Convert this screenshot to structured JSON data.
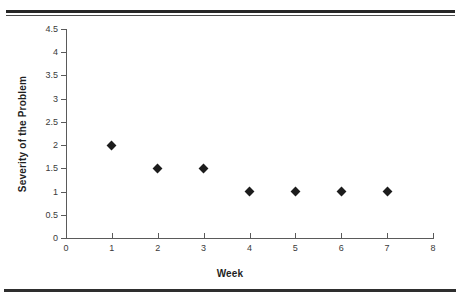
{
  "figure": {
    "background_color": "#ffffff",
    "rule_color": "#2b2b2b",
    "axis_color": "#5a5a5a",
    "marker_color": "#1c1c1c",
    "top_rule_label": "top-double-rule",
    "bottom_rule_label": "bottom-rule"
  },
  "chart_data": {
    "type": "scatter",
    "title": "",
    "subtitle": "",
    "xlabel": "Week",
    "ylabel": "Severity of the Problem",
    "x": [
      1,
      2,
      3,
      4,
      5,
      6,
      7
    ],
    "values": [
      2,
      1.5,
      1.5,
      1,
      1,
      1,
      1
    ],
    "series": [
      {
        "name": "Severity of the Problem",
        "x": [
          1,
          2,
          3,
          4,
          5,
          6,
          7
        ],
        "values": [
          2,
          1.5,
          1.5,
          1,
          1,
          1,
          1
        ],
        "marker": "diamond",
        "color": "#1c1c1c"
      }
    ],
    "xlim": [
      0,
      8
    ],
    "ylim": [
      0,
      4.5
    ],
    "xticks": [
      0,
      1,
      2,
      3,
      4,
      5,
      6,
      7,
      8
    ],
    "xtick_labels": [
      "0",
      "1",
      "2",
      "3",
      "4",
      "5",
      "6",
      "7",
      "8"
    ],
    "yticks": [
      0,
      0.5,
      1,
      1.5,
      2,
      2.5,
      3,
      3.5,
      4,
      4.5
    ],
    "ytick_labels": [
      "0",
      "0.5",
      "1",
      "1.5",
      "2",
      "2.5",
      "3",
      "3.5",
      "4",
      "4.5"
    ],
    "grid": false,
    "legend": false,
    "legend_position": "none",
    "annotations": []
  }
}
